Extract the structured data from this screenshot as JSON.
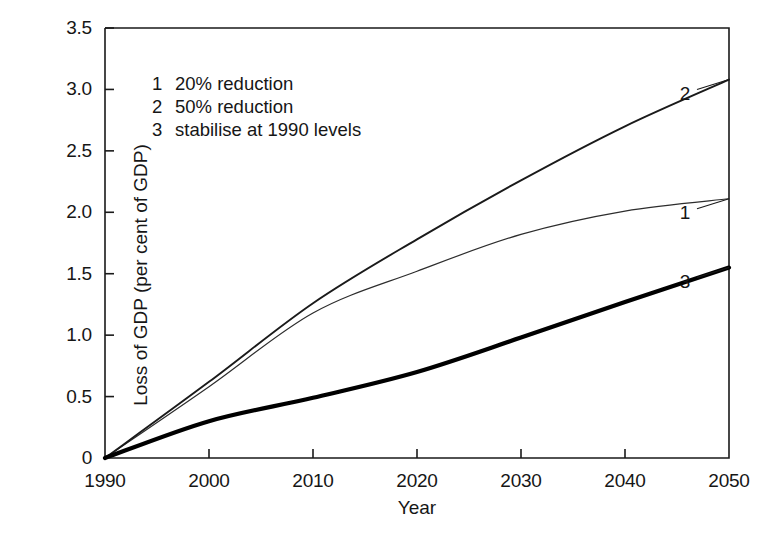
{
  "chart_data": {
    "type": "line",
    "title": "",
    "xlabel": "Year",
    "ylabel": "Loss of GDP (per cent of GDP)",
    "xlim": [
      1990,
      2050
    ],
    "ylim": [
      0,
      3.5
    ],
    "xticks": [
      1990,
      2000,
      2010,
      2020,
      2030,
      2040,
      2050
    ],
    "xtick_labels": [
      "1990",
      "2000",
      "2010",
      "2020",
      "2030",
      "2040",
      "2050"
    ],
    "yticks": [
      0,
      0.5,
      1.0,
      1.5,
      2.0,
      2.5,
      3.0,
      3.5
    ],
    "ytick_labels": [
      "0",
      "0.5",
      "1.0",
      "1.5",
      "2.0",
      "2.5",
      "3.0",
      "3.5"
    ],
    "grid": false,
    "legend_position": "upper-left-inside",
    "x": [
      1990,
      2000,
      2010,
      2020,
      2030,
      2040,
      2050
    ],
    "series": [
      {
        "name": "1",
        "key": "1",
        "label": "20% reduction",
        "color": "#2d2d2d",
        "line_width": 1.2,
        "end_label": "1",
        "values": [
          0.0,
          0.58,
          1.18,
          1.52,
          1.82,
          2.01,
          2.11
        ]
      },
      {
        "name": "2",
        "key": "2",
        "label": "50% reduction",
        "color": "#1a1a1a",
        "line_width": 1.9,
        "end_label": "2",
        "values": [
          0.0,
          0.62,
          1.26,
          1.78,
          2.26,
          2.7,
          3.08
        ]
      },
      {
        "name": "3",
        "key": "3",
        "label": "stabilise at 1990 levels",
        "color": "#000000",
        "line_width": 4.2,
        "end_label": "3",
        "values": [
          0.0,
          0.3,
          0.49,
          0.7,
          0.98,
          1.27,
          1.55
        ]
      }
    ],
    "legend_entries": [
      {
        "key": "1",
        "text": "20% reduction"
      },
      {
        "key": "2",
        "text": "50% reduction"
      },
      {
        "key": "3",
        "text": "stabilise at 1990 levels"
      }
    ],
    "axis_color": "#1a1a1a",
    "background": "#ffffff"
  }
}
